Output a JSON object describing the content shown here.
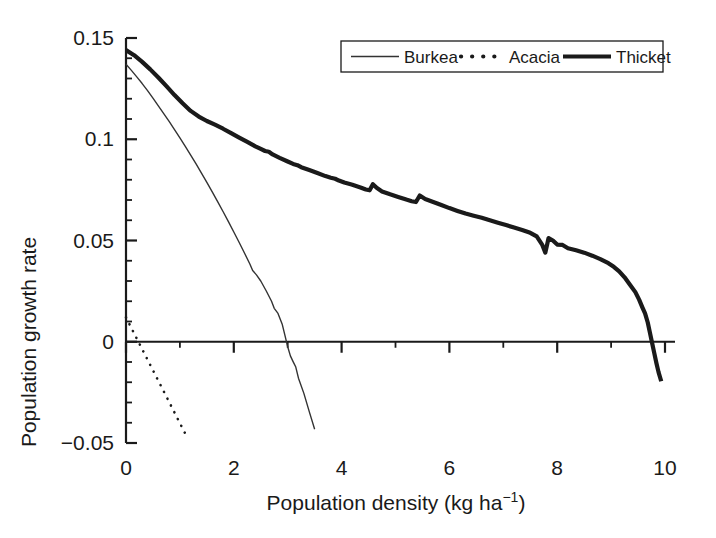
{
  "chart_data": {
    "type": "line",
    "title": "",
    "subtitle": "",
    "xlabel": "Population density  (kg ha",
    "xlabel_sup": "-1",
    "xlabel_tail": ")",
    "ylabel": "Population growth rate",
    "xlim": [
      0,
      10
    ],
    "ylim": [
      -0.05,
      0.15
    ],
    "xticks": [
      0,
      2,
      4,
      6,
      8,
      10
    ],
    "xtick_labels": [
      "0",
      "2",
      "4",
      "6",
      "8",
      "10"
    ],
    "xminor_step": 1,
    "yticks": [
      -0.05,
      0,
      0.05,
      0.1,
      0.15
    ],
    "ytick_labels": [
      "-0.05",
      "0",
      "0.05",
      "0.1",
      "0.15"
    ],
    "yminor_step": 0.01,
    "grid": false,
    "legend_position": "top-right",
    "legend_border": true,
    "zero_line": true,
    "colors": {
      "axis": "#1a1a1a",
      "burkea": "#333333",
      "acacia": "#1a1a1a",
      "thicket": "#1a1a1a",
      "background": "#ffffff"
    },
    "series": [
      {
        "name": "Burkea",
        "style": "thin-solid",
        "linewidth": 1.4,
        "points": [
          [
            0.0,
            0.137
          ],
          [
            0.1,
            0.134
          ],
          [
            0.2,
            0.1308
          ],
          [
            0.3,
            0.1275
          ],
          [
            0.4,
            0.124
          ],
          [
            0.5,
            0.1203
          ],
          [
            0.6,
            0.1165
          ],
          [
            0.7,
            0.1127
          ],
          [
            0.8,
            0.1088
          ],
          [
            0.9,
            0.1048
          ],
          [
            1.0,
            0.1007
          ],
          [
            1.1,
            0.0965
          ],
          [
            1.2,
            0.0922
          ],
          [
            1.3,
            0.0878
          ],
          [
            1.4,
            0.0833
          ],
          [
            1.5,
            0.0787
          ],
          [
            1.6,
            0.074
          ],
          [
            1.7,
            0.0692
          ],
          [
            1.8,
            0.0643
          ],
          [
            1.9,
            0.0593
          ],
          [
            2.0,
            0.0542
          ],
          [
            2.1,
            0.049
          ],
          [
            2.2,
            0.0437
          ],
          [
            2.3,
            0.0383
          ],
          [
            2.35,
            0.0352
          ],
          [
            2.42,
            0.033
          ],
          [
            2.5,
            0.03
          ],
          [
            2.6,
            0.0252
          ],
          [
            2.7,
            0.02
          ],
          [
            2.75,
            0.0165
          ],
          [
            2.82,
            0.014
          ],
          [
            2.9,
            0.0085
          ],
          [
            2.95,
            0.003
          ],
          [
            3.0,
            -0.0025
          ],
          [
            3.05,
            -0.007
          ],
          [
            3.1,
            -0.0098
          ],
          [
            3.15,
            -0.0125
          ],
          [
            3.2,
            -0.018
          ],
          [
            3.3,
            -0.0255
          ],
          [
            3.4,
            -0.0345
          ],
          [
            3.5,
            -0.0432
          ]
        ]
      },
      {
        "name": "Acacia",
        "style": "dotted",
        "linewidth": 2.6,
        "points": [
          [
            0.0,
            0.012
          ],
          [
            1.15,
            -0.048
          ]
        ]
      },
      {
        "name": "Thicket",
        "style": "thick-solid",
        "linewidth": 4.2,
        "points": [
          [
            0.0,
            0.144
          ],
          [
            0.15,
            0.1415
          ],
          [
            0.3,
            0.1382
          ],
          [
            0.45,
            0.1345
          ],
          [
            0.6,
            0.1305
          ],
          [
            0.75,
            0.1262
          ],
          [
            0.9,
            0.1218
          ],
          [
            1.05,
            0.1178
          ],
          [
            1.2,
            0.114
          ],
          [
            1.35,
            0.1112
          ],
          [
            1.5,
            0.109
          ],
          [
            1.65,
            0.1072
          ],
          [
            1.8,
            0.1052
          ],
          [
            1.95,
            0.103
          ],
          [
            2.1,
            0.1008
          ],
          [
            2.25,
            0.0987
          ],
          [
            2.4,
            0.0965
          ],
          [
            2.5,
            0.0952
          ],
          [
            2.58,
            0.0942
          ],
          [
            2.65,
            0.0938
          ],
          [
            2.72,
            0.0925
          ],
          [
            2.85,
            0.0908
          ],
          [
            3.0,
            0.089
          ],
          [
            3.1,
            0.0878
          ],
          [
            3.18,
            0.0872
          ],
          [
            3.25,
            0.0862
          ],
          [
            3.4,
            0.0848
          ],
          [
            3.55,
            0.0833
          ],
          [
            3.7,
            0.0818
          ],
          [
            3.8,
            0.081
          ],
          [
            3.88,
            0.0805
          ],
          [
            3.95,
            0.0796
          ],
          [
            4.05,
            0.0786
          ],
          [
            4.2,
            0.0775
          ],
          [
            4.35,
            0.0762
          ],
          [
            4.45,
            0.0752
          ],
          [
            4.52,
            0.0748
          ],
          [
            4.58,
            0.0778
          ],
          [
            4.65,
            0.076
          ],
          [
            4.75,
            0.0742
          ],
          [
            4.9,
            0.0728
          ],
          [
            5.05,
            0.0715
          ],
          [
            5.2,
            0.0702
          ],
          [
            5.3,
            0.0694
          ],
          [
            5.38,
            0.069
          ],
          [
            5.45,
            0.0722
          ],
          [
            5.55,
            0.0705
          ],
          [
            5.7,
            0.069
          ],
          [
            5.85,
            0.0675
          ],
          [
            6.0,
            0.066
          ],
          [
            6.15,
            0.0646
          ],
          [
            6.3,
            0.0633
          ],
          [
            6.45,
            0.0622
          ],
          [
            6.6,
            0.0612
          ],
          [
            6.75,
            0.06
          ],
          [
            6.9,
            0.0588
          ],
          [
            7.05,
            0.0576
          ],
          [
            7.2,
            0.0564
          ],
          [
            7.35,
            0.0552
          ],
          [
            7.5,
            0.0538
          ],
          [
            7.62,
            0.052
          ],
          [
            7.72,
            0.048
          ],
          [
            7.78,
            0.044
          ],
          [
            7.84,
            0.0512
          ],
          [
            7.92,
            0.05
          ],
          [
            8.0,
            0.048
          ],
          [
            8.1,
            0.0478
          ],
          [
            8.2,
            0.0462
          ],
          [
            8.35,
            0.0452
          ],
          [
            8.5,
            0.044
          ],
          [
            8.65,
            0.0425
          ],
          [
            8.8,
            0.0408
          ],
          [
            8.95,
            0.0388
          ],
          [
            9.05,
            0.037
          ],
          [
            9.15,
            0.0348
          ],
          [
            9.25,
            0.0318
          ],
          [
            9.35,
            0.0282
          ],
          [
            9.45,
            0.0245
          ],
          [
            9.52,
            0.0208
          ],
          [
            9.58,
            0.017
          ],
          [
            9.63,
            0.014
          ],
          [
            9.68,
            0.0095
          ],
          [
            9.72,
            0.0045
          ],
          [
            9.76,
            -0.0005
          ],
          [
            9.8,
            -0.0055
          ],
          [
            9.84,
            -0.0105
          ],
          [
            9.88,
            -0.015
          ],
          [
            9.93,
            -0.0195
          ]
        ]
      }
    ],
    "legend": [
      {
        "label": "Burkea",
        "style": "thin-solid"
      },
      {
        "label": "Acacia",
        "style": "dotted"
      },
      {
        "label": "Thicket",
        "style": "thick-solid"
      }
    ]
  }
}
